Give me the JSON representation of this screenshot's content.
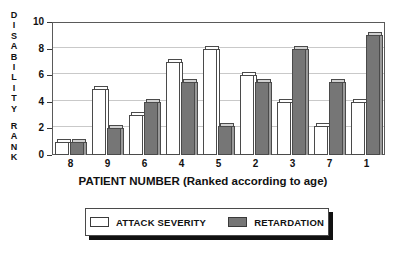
{
  "chart_data": {
    "type": "bar",
    "title": "",
    "xlabel": "PATIENT NUMBER (Ranked according to age)",
    "ylabel": "DISABILITY RANK",
    "categories": [
      "8",
      "9",
      "6",
      "4",
      "5",
      "2",
      "3",
      "7",
      "1"
    ],
    "series": [
      {
        "name": "ATTACK SEVERITY",
        "color": "#ffffff",
        "values": [
          1.0,
          5.0,
          3.0,
          7.0,
          8.0,
          6.0,
          4.0,
          2.2,
          4.0
        ]
      },
      {
        "name": "RETARDATION",
        "color": "#767676",
        "values": [
          1.0,
          2.0,
          4.0,
          5.5,
          2.2,
          5.5,
          8.0,
          5.5,
          9.0
        ]
      }
    ],
    "ylim": [
      0,
      10
    ],
    "yticks": [
      0,
      2,
      4,
      6,
      8,
      10
    ],
    "ytick_labels": [
      "0",
      "2",
      "4",
      "6",
      "8",
      "10"
    ],
    "grid": true,
    "legend_position": "bottom"
  },
  "axis": {
    "y_caption_letters": [
      "D",
      "I",
      "S",
      "A",
      "B",
      "I",
      "L",
      "I",
      "T",
      "Y",
      "",
      "R",
      "A",
      "N",
      "K"
    ],
    "x_title": "PATIENT NUMBER (Ranked according to age)"
  },
  "legend": {
    "items": [
      {
        "label": "ATTACK SEVERITY",
        "swatch": "white"
      },
      {
        "label": "RETARDATION",
        "swatch": "gray"
      }
    ]
  }
}
